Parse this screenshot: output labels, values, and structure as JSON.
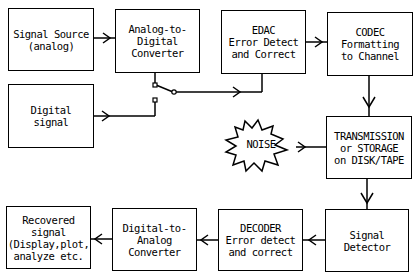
{
  "diagram": {
    "blocks": [
      {
        "id": "signal_source",
        "label": "Signal Source\n(analog)"
      },
      {
        "id": "adc",
        "label": "Analog-to-\nDigital\nConverter"
      },
      {
        "id": "edac",
        "label": "EDAC\nError Detect\nand Correct"
      },
      {
        "id": "codec",
        "label": "CODEC\nFormatting\nto Channel"
      },
      {
        "id": "digital_signal",
        "label": "Digital\nsignal"
      },
      {
        "id": "transmission",
        "label": "TRANSMISSION\nor STORAGE\non DISK/TAPE"
      },
      {
        "id": "signal_detector",
        "label": "Signal\nDetector"
      },
      {
        "id": "decoder",
        "label": "DECODER\nError detect\nand correct"
      },
      {
        "id": "dac",
        "label": "Digital-to-\nAnalog\nConverter"
      },
      {
        "id": "recovered",
        "label": "Recovered\nsignal\n(Display,plot,\nanalyze etc."
      }
    ],
    "noise": {
      "label": "NOISE"
    },
    "edges": [
      {
        "from": "signal_source",
        "to": "adc"
      },
      {
        "from": "adc",
        "to": "switch"
      },
      {
        "from": "digital_signal",
        "to": "switch"
      },
      {
        "from": "switch",
        "to": "edac"
      },
      {
        "from": "edac",
        "to": "codec"
      },
      {
        "from": "codec",
        "to": "transmission"
      },
      {
        "from": "noise",
        "to": "transmission"
      },
      {
        "from": "transmission",
        "to": "signal_detector"
      },
      {
        "from": "signal_detector",
        "to": "decoder"
      },
      {
        "from": "decoder",
        "to": "dac"
      },
      {
        "from": "dac",
        "to": "recovered"
      }
    ]
  }
}
